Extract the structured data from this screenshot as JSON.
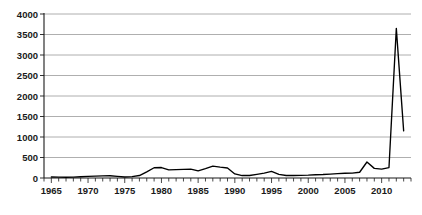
{
  "chart_data": {
    "type": "line",
    "title": "",
    "subtitle": "",
    "xlabel": "",
    "ylabel": "",
    "xlim": [
      1964,
      2014
    ],
    "ylim": [
      0,
      4000
    ],
    "ytick_values": [
      0,
      500,
      1000,
      1500,
      2000,
      2500,
      3000,
      3500,
      4000
    ],
    "ytick_labels": [
      "0",
      "500",
      "1000",
      "1500",
      "2000",
      "2500",
      "3000",
      "3500",
      "4000"
    ],
    "xtick_values": [
      1965,
      1970,
      1975,
      1980,
      1985,
      1990,
      1995,
      2000,
      2005,
      2010
    ],
    "xtick_labels": [
      "1965",
      "1970",
      "1975",
      "1980",
      "1985",
      "1990",
      "1995",
      "2000",
      "2005",
      "2010"
    ],
    "x_minor_tick_step": 1,
    "grid": "horizontal",
    "legend": "none",
    "line_color": "#000000",
    "grid_color": "#9a9a9a",
    "axis_color": "#1a1a1a",
    "background_color": "#ffffff",
    "series": [
      {
        "name": "value",
        "x": [
          1965,
          1966,
          1967,
          1968,
          1969,
          1970,
          1971,
          1972,
          1973,
          1974,
          1975,
          1976,
          1977,
          1978,
          1979,
          1980,
          1981,
          1982,
          1983,
          1984,
          1985,
          1986,
          1987,
          1988,
          1989,
          1990,
          1991,
          1992,
          1993,
          1994,
          1995,
          1996,
          1997,
          1998,
          1999,
          2000,
          2001,
          2002,
          2003,
          2004,
          2005,
          2006,
          2007,
          2008,
          2009,
          2010,
          2011,
          2012,
          2013
        ],
        "values": [
          25,
          20,
          18,
          22,
          30,
          40,
          45,
          50,
          55,
          40,
          25,
          35,
          60,
          150,
          250,
          255,
          200,
          205,
          210,
          215,
          175,
          230,
          290,
          265,
          245,
          100,
          60,
          60,
          90,
          120,
          160,
          90,
          60,
          60,
          65,
          70,
          80,
          85,
          95,
          105,
          115,
          120,
          140,
          390,
          235,
          215,
          255,
          3650,
          1150
        ]
      }
    ],
    "peak": {
      "x": 2012,
      "y": 3650
    },
    "end_point": {
      "x": 2013,
      "y": 1150
    }
  }
}
